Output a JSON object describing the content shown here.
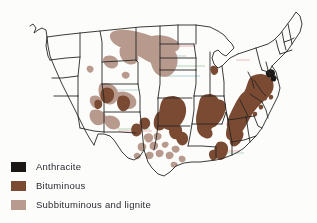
{
  "figure": {
    "kind": "thematic-map",
    "region": "United States",
    "background_color": "#fdfdfc"
  },
  "colors": {
    "anthracite": "#1a1714",
    "bituminous": "#7a4a32",
    "subbituminous_lignite": "#b89b8e",
    "state_border": "#262626",
    "artifact_red": "#cf4b4b",
    "artifact_green": "#5aa564",
    "artifact_teal": "#4fa6a0"
  },
  "legend": {
    "items": [
      {
        "label": "Anthracite",
        "color_key": "anthracite",
        "swatch": "#1a1714"
      },
      {
        "label": "Bituminous",
        "color_key": "bituminous",
        "swatch": "#7a4a32"
      },
      {
        "label": "Subbituminous and lignite",
        "color_key": "subbituminous_lignite",
        "swatch": "#b89b8e"
      }
    ]
  },
  "deposits": {
    "anthracite_regions": [
      "Eastern Pennsylvania"
    ],
    "bituminous_regions": [
      "Appalachian Basin (Pennsylvania, West Virginia, Kentucky, Virginia, Tennessee)",
      "Illinois Basin (Illinois, Indiana, western Kentucky)",
      "Western Interior (Iowa, Missouri, Kansas, Oklahoma, Arkansas)",
      "Alabama",
      "Colorado and Utah"
    ],
    "subbituminous_lignite_regions": [
      "Powder River Basin (Montana, Wyoming)",
      "North Dakota lignite",
      "Texas Gulf Coast lignite",
      "Mississippi and Louisiana lignite",
      "New Mexico and Arizona"
    ]
  }
}
